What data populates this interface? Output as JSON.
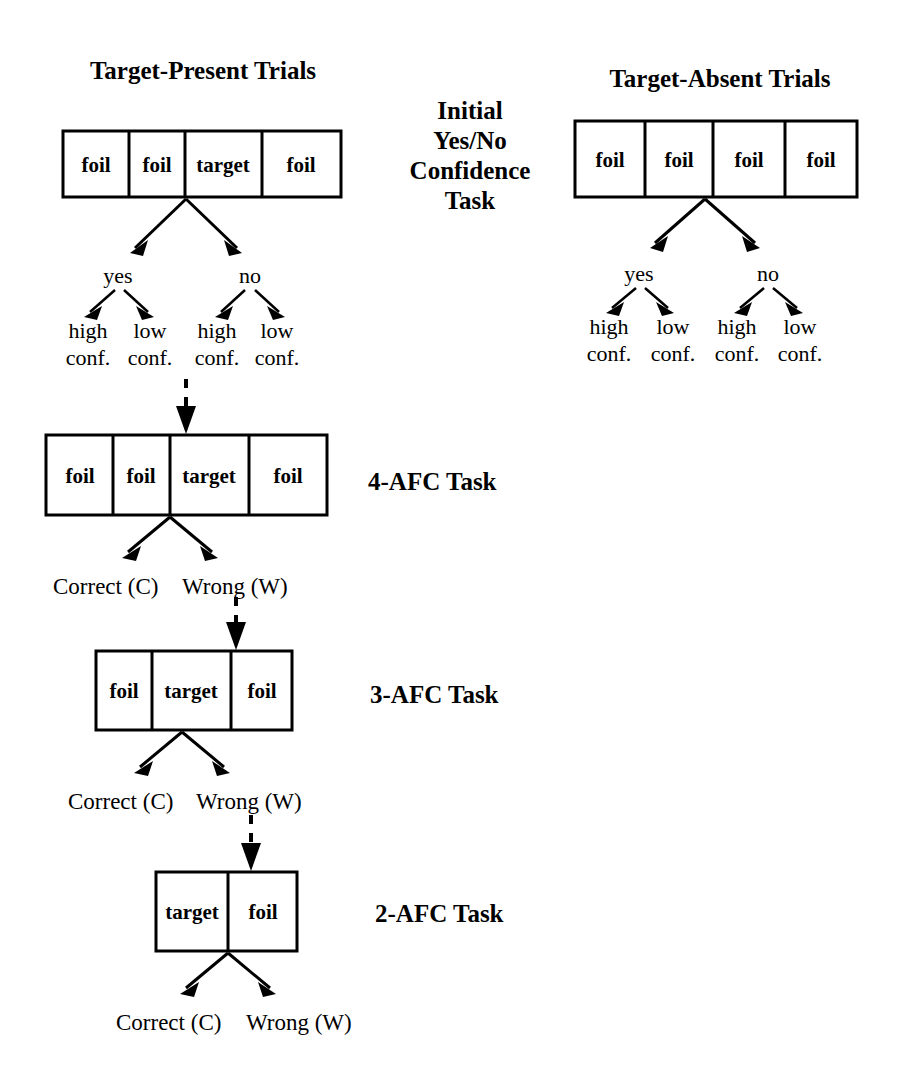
{
  "figure": {
    "type": "flowchart",
    "columns": [
      {
        "id": "target-present",
        "title": "Target-Present Trials"
      },
      {
        "id": "target-absent",
        "title": "Target-Absent Trials"
      }
    ],
    "stage_labels": {
      "initial": [
        "Initial",
        "Yes/No",
        "Confidence",
        "Task"
      ],
      "afc4": "4-AFC Task",
      "afc3": "3-AFC Task",
      "afc2": "2-AFC Task"
    },
    "arrays": {
      "present_initial": [
        "foil",
        "foil",
        "target",
        "foil"
      ],
      "absent_initial": [
        "foil",
        "foil",
        "foil",
        "foil"
      ],
      "afc4": [
        "foil",
        "foil",
        "target",
        "foil"
      ],
      "afc3": [
        "foil",
        "target",
        "foil"
      ],
      "afc2": [
        "target",
        "foil"
      ]
    },
    "responses": {
      "yes": "yes",
      "no": "no",
      "high_conf": [
        "high",
        "conf."
      ],
      "low_conf": [
        "low",
        "conf."
      ],
      "correct": "Correct (C)",
      "wrong": "Wrong (W)"
    },
    "present_branch_leaves": [
      [
        "high",
        "conf."
      ],
      [
        "low",
        "conf."
      ],
      [
        "high",
        "conf."
      ],
      [
        "low",
        "conf."
      ]
    ],
    "absent_branch_leaves": [
      [
        "high",
        "conf."
      ],
      [
        "low",
        "conf."
      ],
      [
        "high",
        "conf."
      ],
      [
        "low",
        "conf."
      ]
    ],
    "colors": {
      "ink": "#000000",
      "background": "#ffffff"
    }
  }
}
